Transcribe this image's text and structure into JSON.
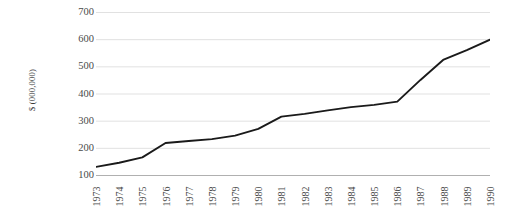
{
  "chart_data": {
    "type": "line",
    "title": "",
    "xlabel": "",
    "ylabel": "$ (000,000)",
    "categories": [
      "1973",
      "1974",
      "1975",
      "1976",
      "1977",
      "1978",
      "1979",
      "1980",
      "1981",
      "1982",
      "1983",
      "1984",
      "1985",
      "1986",
      "1987",
      "1988",
      "1989",
      "1990"
    ],
    "values": [
      130,
      145,
      165,
      218,
      225,
      232,
      245,
      270,
      315,
      325,
      338,
      350,
      358,
      370,
      450,
      525,
      560,
      598
    ],
    "ylim": [
      100,
      700
    ],
    "yticks": [
      100,
      200,
      300,
      400,
      500,
      600,
      700
    ],
    "ytick_labels": [
      "100",
      "200",
      "300",
      "400",
      "500",
      "600",
      "700"
    ],
    "grid": true,
    "grid_axis": "y",
    "legend": false,
    "legend_position": "none",
    "series": [
      {
        "name": "",
        "color": "#1a1a1a",
        "values": [
          130,
          145,
          165,
          218,
          225,
          232,
          245,
          270,
          315,
          325,
          338,
          350,
          358,
          370,
          450,
          525,
          560,
          598
        ]
      }
    ],
    "colors": {
      "line": "#1a1a1a",
      "grid": "#d9d9d9",
      "axis": "#b0b0b0",
      "text": "#4a4a4a",
      "background": "#ffffff"
    }
  }
}
